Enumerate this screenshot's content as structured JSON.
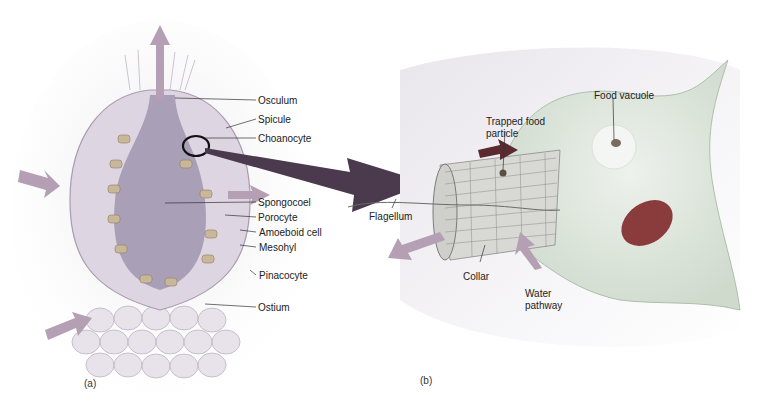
{
  "figure": {
    "panel_a": {
      "tag": "(a)",
      "labels": [
        {
          "text": "Osculum",
          "x": 258,
          "y": 95
        },
        {
          "text": "Spicule",
          "x": 258,
          "y": 114
        },
        {
          "text": "Choanocyte",
          "x": 258,
          "y": 133
        },
        {
          "text": "Spongocoel",
          "x": 258,
          "y": 197
        },
        {
          "text": "Porocyte",
          "x": 258,
          "y": 212
        },
        {
          "text": "Amoeboid cell",
          "x": 259,
          "y": 227
        },
        {
          "text": "Mesohyl",
          "x": 259,
          "y": 242
        },
        {
          "text": "Pinacocyte",
          "x": 259,
          "y": 270
        },
        {
          "text": "Ostium",
          "x": 258,
          "y": 302
        }
      ]
    },
    "panel_b": {
      "tag": "(b)",
      "labels": [
        {
          "text": "Food vacuole",
          "x": 594,
          "y": 90
        },
        {
          "text": "Trapped food",
          "x": 486,
          "y": 116
        },
        {
          "text": "particle",
          "x": 486,
          "y": 128
        },
        {
          "text": "Flagellum",
          "x": 369,
          "y": 211
        },
        {
          "text": "Collar",
          "x": 463,
          "y": 271
        },
        {
          "text": "Water",
          "x": 525,
          "y": 288
        },
        {
          "text": "pathway",
          "x": 525,
          "y": 300
        }
      ]
    },
    "colors": {
      "sponge_body": "#d8cfe0",
      "cavity": "#a89db8",
      "arrow": "#a895a8",
      "big_arrow": "#4b3a4e",
      "cell_body": "#dfe8de",
      "nucleus": "#8a3b3b",
      "dark_arrow": "#5a2a30"
    }
  }
}
